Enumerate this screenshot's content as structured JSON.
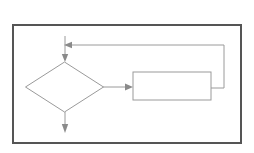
{
  "document": {
    "title": "Flowchart Diagram",
    "canvas": {
      "width": 254,
      "height": 153,
      "background_color": "#ffffff"
    }
  },
  "frame": {
    "name": "outer-border",
    "x": 12,
    "y": 24,
    "width": 230,
    "height": 120,
    "stroke_color": "#555555",
    "stroke_width": 2,
    "fill_color": "#ffffff",
    "label": ""
  },
  "diagram": {
    "type": "flowchart",
    "stroke_color": "#9a9a9a",
    "stroke_width": 1,
    "fill_color": "#ffffff",
    "arrow_color": "#8a8a8a",
    "nodes": [
      {
        "id": "decision",
        "name": "decision-diamond",
        "shape": "diamond",
        "label": "",
        "center_x": 64.5,
        "center_y": 87,
        "half_width": 39,
        "half_height": 25,
        "left_x": 25.5,
        "right_x": 103.5,
        "top_y": 62,
        "bottom_y": 112
      },
      {
        "id": "process",
        "name": "process-rectangle",
        "shape": "rectangle",
        "label": "",
        "x": 133,
        "y": 72,
        "width": 78,
        "height": 28
      }
    ],
    "connectors": [
      {
        "id": "entry",
        "name": "entry-arrow",
        "label": "",
        "from": "top-entry-point",
        "to": "decision",
        "points": [
          [
            65,
            36
          ],
          [
            65,
            61
          ]
        ],
        "arrowhead": "down",
        "arrow_at": [
          65,
          59
        ]
      },
      {
        "id": "feedback-arrow-head",
        "name": "feedback-arrow",
        "label": "",
        "from": "process",
        "to": "entry-line",
        "points": [
          [
            224,
            45
          ],
          [
            68,
            45
          ]
        ],
        "arrowhead": "left",
        "arrow_at": [
          66,
          45
        ]
      },
      {
        "id": "feedback-riser",
        "name": "feedback-riser-line",
        "label": "",
        "from": "process",
        "to": "feedback-top",
        "points": [
          [
            211,
            88
          ],
          [
            224,
            88
          ],
          [
            224,
            45
          ]
        ],
        "arrowhead": "none"
      },
      {
        "id": "decision-to-process",
        "name": "decision-to-process-arrow",
        "label": "",
        "from": "decision",
        "to": "process",
        "points": [
          [
            103,
            87
          ],
          [
            130,
            87
          ]
        ],
        "arrowhead": "right",
        "arrow_at": [
          132,
          87
        ]
      },
      {
        "id": "exit",
        "name": "exit-arrow",
        "label": "",
        "from": "decision",
        "to": "exit-point",
        "points": [
          [
            65,
            112
          ],
          [
            65,
            128
          ]
        ],
        "arrowhead": "down",
        "arrow_at": [
          65,
          132
        ]
      }
    ]
  }
}
